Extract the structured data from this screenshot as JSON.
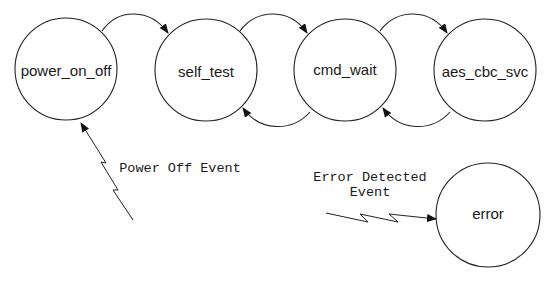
{
  "diagram": {
    "type": "state-machine",
    "states": [
      {
        "id": "power_on_off",
        "label": "power_on_off"
      },
      {
        "id": "self_test",
        "label": "self_test"
      },
      {
        "id": "cmd_wait",
        "label": "cmd_wait"
      },
      {
        "id": "aes_cbc_svc",
        "label": "aes_cbc_svc"
      },
      {
        "id": "error",
        "label": "error"
      }
    ],
    "transitions": [
      {
        "from": "power_on_off",
        "to": "self_test"
      },
      {
        "from": "self_test",
        "to": "cmd_wait"
      },
      {
        "from": "cmd_wait",
        "to": "self_test"
      },
      {
        "from": "cmd_wait",
        "to": "aes_cbc_svc"
      },
      {
        "from": "aes_cbc_svc",
        "to": "cmd_wait"
      }
    ],
    "events": [
      {
        "id": "power-off-event",
        "lines": [
          "Power Off Event"
        ],
        "target": "power_on_off",
        "icon": "lightning-bolt-arrow"
      },
      {
        "id": "error-detected-event",
        "lines": [
          "Error Detected",
          "Event"
        ],
        "target": "error",
        "icon": "lightning-bolt-arrow"
      }
    ],
    "colors": {
      "stroke": "#222222",
      "text": "#1a1a1a",
      "background": "#ffffff"
    }
  }
}
